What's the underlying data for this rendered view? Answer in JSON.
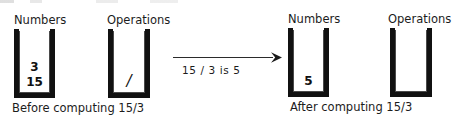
{
  "figure": {
    "kind": "stack-machine-evaluation-diagram",
    "arrow": {
      "icon": "right-arrow-icon",
      "label": "15  /  3  is  5"
    }
  },
  "before": {
    "caption": "Before computing 15/3",
    "stacks": [
      {
        "title": "Numbers",
        "name": "numbers",
        "items": [
          "3",
          "15"
        ]
      },
      {
        "title": "Operations",
        "name": "operations",
        "items": [
          "/"
        ]
      }
    ]
  },
  "after": {
    "caption": "After computing 15/3",
    "stacks": [
      {
        "title": "Numbers",
        "name": "numbers",
        "items": [
          "5"
        ]
      },
      {
        "title": "Operations",
        "name": "operations",
        "items": []
      }
    ]
  },
  "colors": {
    "stack_wall": "#111111",
    "stack_inner_line": "#4a4a4a",
    "text": "#1c1c1c",
    "background": "#ffffff"
  }
}
